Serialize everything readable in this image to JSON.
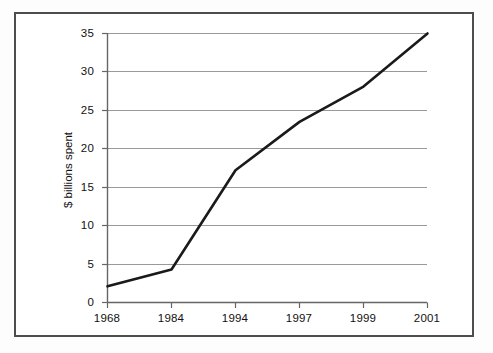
{
  "chart_data": {
    "type": "line",
    "title": "",
    "subtitle": "",
    "xlabel": "",
    "ylabel": "$ billions spent",
    "categories": [
      "1968",
      "1984",
      "1994",
      "1997",
      "1999",
      "2001"
    ],
    "x": [
      1968,
      1984,
      1994,
      1997,
      1999,
      2001
    ],
    "values": [
      2.1,
      4.3,
      17.2,
      23.5,
      28.1,
      35.0
    ],
    "series": [
      {
        "name": "$ billions spent",
        "values": [
          2.1,
          4.3,
          17.2,
          23.5,
          28.1,
          35.0
        ],
        "color": "#1a1a1a"
      }
    ],
    "ylim": [
      0,
      35
    ],
    "yticks": [
      0,
      5,
      10,
      15,
      20,
      25,
      30,
      35
    ],
    "ytick_labels": [
      "0",
      "5",
      "10",
      "15",
      "20",
      "25",
      "30",
      "35"
    ],
    "xtick_labels": [
      "1968",
      "1984",
      "1994",
      "1997",
      "1999",
      "2001"
    ],
    "grid": "horizontal",
    "gridline_color": "#999999",
    "axis_color": "#666666",
    "legend": "none",
    "legend_position": "none",
    "frame_color": "#4d4d4d",
    "background": "#ffffff",
    "annotations": []
  },
  "axes": {
    "y_label": "$ billions spent",
    "y_ticks": [
      "0",
      "5",
      "10",
      "15",
      "20",
      "25",
      "30",
      "35"
    ],
    "x_ticks": [
      "1968",
      "1984",
      "1994",
      "1997",
      "1999",
      "2001"
    ]
  }
}
